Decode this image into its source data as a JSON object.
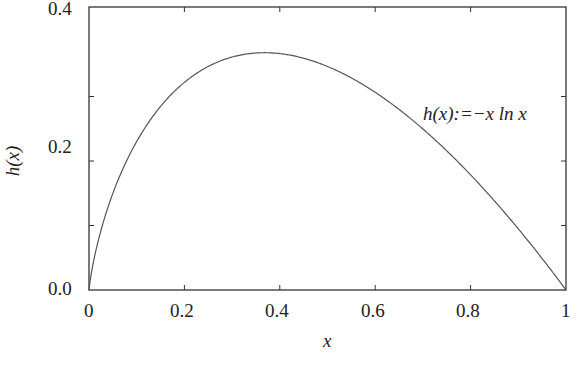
{
  "chart_data": {
    "type": "line",
    "title": "",
    "xlabel": "x",
    "ylabel": "h(x)",
    "xlim": [
      0,
      1
    ],
    "ylim": [
      0,
      0.4
    ],
    "x_ticks": [
      "0",
      "0.2",
      "0.4",
      "0.6",
      "0.8",
      "1"
    ],
    "y_ticks": [
      "0.0",
      "0.2",
      "0.4"
    ],
    "grid": false,
    "annotation": "h(x):=−x ln x",
    "series": [
      {
        "name": "h(x) = -x ln x",
        "x": [
          0,
          0.01,
          0.05,
          0.1,
          0.15,
          0.2,
          0.25,
          0.3,
          0.3679,
          0.4,
          0.5,
          0.6,
          0.7,
          0.8,
          0.9,
          1.0
        ],
        "values": [
          0,
          0.046,
          0.15,
          0.23,
          0.285,
          0.322,
          0.347,
          0.361,
          0.368,
          0.367,
          0.347,
          0.306,
          0.25,
          0.179,
          0.095,
          0
        ]
      }
    ],
    "colors": {
      "axes": "#333333",
      "curve": "#555555",
      "text": "#222222"
    }
  }
}
